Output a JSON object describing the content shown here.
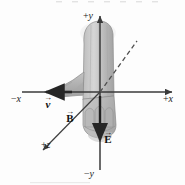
{
  "figure": {
    "background_color": "#fdfdfd",
    "width": 185,
    "height": 185
  },
  "axes": {
    "color": "#3a3a3a",
    "origin": {
      "x": 100,
      "y": 92
    },
    "labels": {
      "pos_y": {
        "sign": "+",
        "name": "y"
      },
      "neg_y": {
        "sign": "−",
        "name": "y"
      },
      "pos_x": {
        "sign": "+",
        "name": "x"
      },
      "neg_x": {
        "sign": "−",
        "name": "x"
      },
      "pos_z": {
        "sign": "+",
        "name": "z"
      }
    }
  },
  "vectors": {
    "velocity": {
      "symbol": "v",
      "accent": "→",
      "direction": "−x",
      "color": "#2b2b2b"
    },
    "magnetic_field": {
      "symbol": "B",
      "accent": "→",
      "direction": "+z",
      "color": "#2b2b2b"
    },
    "electric_field": {
      "symbol": "E",
      "accent": "→",
      "direction": "−y",
      "color": "#2b2b2b"
    }
  },
  "annotations": {
    "dashed_line": {
      "name": "dashed-reference-line",
      "style": "dashed",
      "color": "#5a5a5a"
    }
  },
  "hand": {
    "fill_light": "#c9c9c9",
    "fill_mid": "#b4b4b4",
    "fill_dark": "#9e9e9e",
    "outline": "#7a7a7a"
  }
}
